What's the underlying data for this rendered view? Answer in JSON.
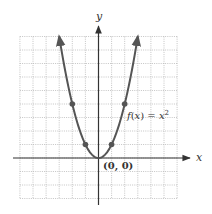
{
  "chart_data": {
    "type": "line",
    "title": "",
    "function_label": "f(x) = x²",
    "function_label_parts": {
      "f": "f",
      "open": "(",
      "x": "x",
      "close": ") = ",
      "x2": "x",
      "exp": "2"
    },
    "xlabel": "x",
    "ylabel": "y",
    "origin_label": "(0, 0)",
    "xlim": [
      -6,
      6
    ],
    "ylim": [
      -3,
      9
    ],
    "grid": true,
    "grid_style": "dotted",
    "series": [
      {
        "name": "f(x) = x^2",
        "x": [
          -3,
          -2.5,
          -2,
          -1.5,
          -1,
          -0.5,
          0,
          0.5,
          1,
          1.5,
          2,
          2.5,
          3
        ],
        "y": [
          9,
          6.25,
          4,
          2.25,
          1,
          0.25,
          0,
          0.25,
          1,
          2.25,
          4,
          6.25,
          9
        ]
      }
    ],
    "marked_points": [
      {
        "x": -2,
        "y": 4
      },
      {
        "x": -1,
        "y": 1
      },
      {
        "x": 0,
        "y": 0
      },
      {
        "x": 1,
        "y": 1
      },
      {
        "x": 2,
        "y": 4
      }
    ],
    "colors": {
      "curve": "#555555",
      "axis": "#333333",
      "grid": "#b5b5b5",
      "text": "#333333"
    }
  }
}
